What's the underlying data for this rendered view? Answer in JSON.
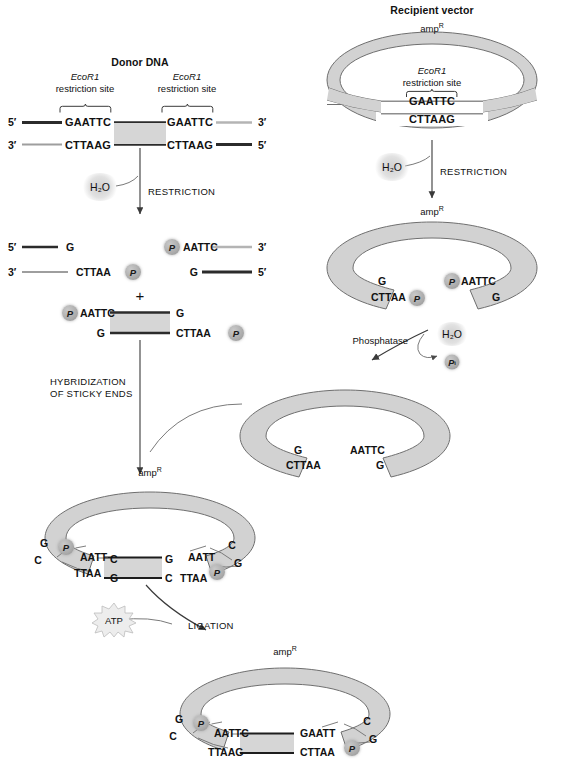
{
  "figure": {
    "domain": "molecular-cloning-diagram",
    "colors": {
      "ink": "#111111",
      "plasmid_band": "#d2d2d2",
      "plasmid_outline": "#6f6f6f",
      "insert_fill": "#d6d6d6",
      "strand_dark": "#2b2b2b",
      "strand_light": "#b4b4b4",
      "chip_gray": "#a9a9a9"
    }
  },
  "donor": {
    "title": "Donor DNA",
    "site_left": {
      "name": "EcoR1",
      "line2": "restriction site"
    },
    "site_right": {
      "name": "EcoR1",
      "line2": "restriction site"
    },
    "top_left_prime": "5′",
    "top_right_prime": "3′",
    "bottom_left_prime": "3′",
    "bottom_right_prime": "5′",
    "top_seq_left": "GAATTC",
    "top_seq_right": "GAATTC",
    "bottom_seq_left": "CTTAAG",
    "bottom_seq_right": "CTTAAG",
    "water": "H₂O",
    "step": "RESTRICTION"
  },
  "donor_fragments": {
    "left_top_prime": "5′",
    "left_top_base": "G",
    "left_bottom_prime": "3′",
    "left_bottom_seq": "CTTAA",
    "left_bottom_chip": "P",
    "right_top_chip": "P",
    "right_top_seq": "AATTC",
    "right_top_prime": "3′",
    "right_bottom_base": "G",
    "right_bottom_prime": "5′",
    "plus": "+",
    "insert_top_chip": "P",
    "insert_top_seq": "AATTC",
    "insert_top_right_base": "G",
    "insert_bottom_left_base": "G",
    "insert_bottom_seq": "CTTAA",
    "insert_bottom_chip": "P",
    "step": "HYBRIDIZATION\nOF STICKY ENDS",
    "step_line1": "HYBRIDIZATION",
    "step_line2": "OF STICKY ENDS"
  },
  "vector": {
    "title": "Recipient vector",
    "marker": "amp",
    "marker_sup": "R",
    "site": {
      "name": "EcoR1",
      "line2": "restriction site"
    },
    "top_seq": "GAATTC",
    "bottom_seq": "CTTAAG",
    "water": "H₂O",
    "step": "RESTRICTION"
  },
  "vector_cut": {
    "marker": "amp",
    "marker_sup": "R",
    "left_top_base": "G",
    "left_bottom_seq": "CTTAA",
    "left_bottom_chip": "P",
    "right_top_chip": "P",
    "right_top_seq": "AATTC",
    "right_bottom_base": "G",
    "enzyme": "Phosphatase",
    "water": "H₂O",
    "product": "P",
    "product_sub": "i"
  },
  "vector_dephos": {
    "left_top_base": "G",
    "left_bottom_seq": "CTTAA",
    "right_top_seq": "AATTC",
    "right_bottom_base": "G"
  },
  "hybrid": {
    "marker": "amp",
    "marker_sup": "R",
    "left_outer_top": "G",
    "left_chip": "P",
    "left_inner_top": "AATT",
    "left_inner_top_end": "C",
    "left_outer_bottom": "C",
    "left_inner_bottom": "TTAA",
    "left_inner_bottom_end": "G",
    "insert_right_top": "G",
    "insert_right_bottom": "C",
    "right_inner_top": "AATT",
    "right_outer_top": "C",
    "right_inner_bottom": "TTAA",
    "right_chip": "P",
    "right_outer_bottom": "G",
    "atp": "ATP",
    "step": "LIGATION"
  },
  "ligated": {
    "marker": "amp",
    "marker_sup": "R",
    "left_outer_top": "G",
    "left_chip": "P",
    "left_top_seq": "AATTC",
    "left_outer_bottom": "C",
    "left_bottom_seq": "TTAAG",
    "right_top_seq": "GAATT",
    "right_chip": "P",
    "right_outer_top": "C",
    "right_bottom_seq": "CTTAA",
    "right_outer_bottom": "G"
  }
}
